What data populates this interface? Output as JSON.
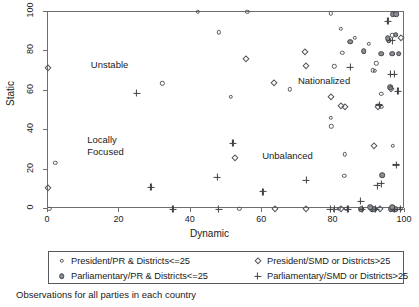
{
  "chart_data": {
    "type": "scatter",
    "title": "",
    "xlabel": "Dynamic",
    "ylabel": "Static",
    "xlim": [
      0,
      100
    ],
    "ylim": [
      0,
      100
    ],
    "xticks": [
      0,
      20,
      40,
      60,
      80,
      100
    ],
    "yticks": [
      0,
      20,
      40,
      60,
      80,
      100
    ],
    "grid": false,
    "legend_position": "below-axes",
    "caption": "Observations for all parties in each country",
    "annotations": [
      {
        "text": "Unstable",
        "x": 12,
        "y": 73
      },
      {
        "text": "Locally",
        "x": 11,
        "y": 35
      },
      {
        "text": "Focused",
        "x": 11,
        "y": 29
      },
      {
        "text": "Nationalized",
        "x": 70,
        "y": 65
      },
      {
        "text": "Unbalanced",
        "x": 60,
        "y": 27
      }
    ],
    "series": [
      {
        "name": "President/PR &  Districts<=25",
        "marker": "open-circle",
        "color": "#55595e",
        "points": [
          [
            0.4,
            0.0
          ],
          [
            2.0,
            23.5
          ],
          [
            32.0,
            63.8
          ],
          [
            42.0,
            100.0
          ],
          [
            47.8,
            89.6
          ],
          [
            51.2,
            56.8
          ],
          [
            53.6,
            0.0
          ],
          [
            55.8,
            100.0
          ],
          [
            67.8,
            60.8
          ],
          [
            79.2,
            99.3
          ],
          [
            79.2,
            46.2
          ],
          [
            79.4,
            42.0
          ],
          [
            80.2,
            72.4
          ],
          [
            82.0,
            91.4
          ],
          [
            82.4,
            79.2
          ],
          [
            83.2,
            27.8
          ],
          [
            83.0,
            16.7
          ],
          [
            89.8,
            84.0
          ],
          [
            91.0,
            70.4
          ],
          [
            91.6,
            70.0
          ],
          [
            92.0,
            73.9
          ],
          [
            93.4,
            58.6
          ],
          [
            96.4,
            88.2
          ],
          [
            96.6,
            32.2
          ],
          [
            97.2,
            0.0
          ],
          [
            98.8,
            0.0
          ],
          [
            81.4,
            0.0
          ],
          [
            83.6,
            0.0
          ],
          [
            86.0,
            87.0
          ],
          [
            93.4,
            51.9
          ]
        ]
      },
      {
        "name": "Parliamentary/PR & Districts<=25",
        "marker": "filled-circle",
        "color": "#8b8f94",
        "points": [
          [
            84.6,
            85.0
          ],
          [
            88.4,
            80.1
          ],
          [
            93.4,
            78.9
          ],
          [
            95.8,
            61.7
          ],
          [
            96.6,
            99.0
          ],
          [
            97.6,
            99.0
          ],
          [
            97.4,
            88.4
          ],
          [
            96.4,
            78.9
          ],
          [
            98.2,
            78.9
          ],
          [
            93.6,
            17.2
          ],
          [
            87.8,
            0.0
          ],
          [
            90.8,
            0.0
          ],
          [
            91.4,
            0.0
          ],
          [
            96.0,
            0.0
          ],
          [
            96.8,
            0.0
          ],
          [
            97.4,
            0.0
          ],
          [
            90.2,
            1.0
          ],
          [
            96.4,
            1.0
          ],
          [
            95.4,
            85.8
          ],
          [
            95.2,
            86.8
          ]
        ]
      },
      {
        "name": "President/SMD or Districts>25",
        "marker": "open-diamond",
        "color": "#55595e",
        "points": [
          [
            0.0,
            71.8
          ],
          [
            0.0,
            10.7
          ],
          [
            52.4,
            25.9
          ],
          [
            55.6,
            76.3
          ],
          [
            63.2,
            63.8
          ],
          [
            63.6,
            0.0
          ],
          [
            72.0,
            79.5
          ],
          [
            72.2,
            72.4
          ],
          [
            72.4,
            0.0
          ],
          [
            79.4,
            57.0
          ],
          [
            82.0,
            52.4
          ],
          [
            83.2,
            51.9
          ],
          [
            82.0,
            0.0
          ],
          [
            91.4,
            32.0
          ],
          [
            92.4,
            52.0
          ],
          [
            93.0,
            0.0
          ],
          [
            98.8,
            86.8
          ],
          [
            96.2,
            61.0
          ]
        ]
      },
      {
        "name": "Parliamentary/SMD or Districts>25",
        "marker": "plus",
        "color": "#3f4246",
        "points": [
          [
            24.8,
            58.8
          ],
          [
            28.8,
            11.0
          ],
          [
            35.0,
            0.0
          ],
          [
            47.4,
            16.0
          ],
          [
            47.8,
            0.0
          ],
          [
            51.8,
            33.4
          ],
          [
            60.2,
            8.8
          ],
          [
            72.4,
            14.6
          ],
          [
            79.0,
            0.0
          ],
          [
            80.2,
            0.0
          ],
          [
            84.0,
            0.0
          ],
          [
            84.6,
            72.0
          ],
          [
            87.6,
            4.0
          ],
          [
            91.8,
            0.0
          ],
          [
            93.4,
            12.8
          ],
          [
            92.2,
            11.8
          ],
          [
            95.2,
            95.2
          ],
          [
            96.0,
            68.4
          ],
          [
            97.0,
            68.4
          ],
          [
            97.6,
            22.4
          ],
          [
            98.0,
            59.8
          ],
          [
            98.6,
            0.0
          ],
          [
            92.8,
            52.8
          ],
          [
            88.0,
            0.0
          ],
          [
            97.0,
            0.0
          ],
          [
            96.4,
            85.4
          ]
        ]
      }
    ]
  },
  "legend": {
    "entries": [
      {
        "label": "President/PR &  Districts<=25",
        "marker": "open-circle"
      },
      {
        "label": "Parliamentary/PR & Districts<=25",
        "marker": "filled-circle"
      },
      {
        "label": "President/SMD or Districts>25",
        "marker": "open-diamond"
      },
      {
        "label": "Parliamentary/SMD or Districts>25",
        "marker": "plus"
      }
    ]
  },
  "caption": "Observations for all parties in each country"
}
